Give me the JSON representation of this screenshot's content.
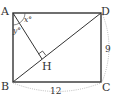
{
  "diagram": {
    "type": "geometry",
    "shape": "rectangle ABCD",
    "vertices": {
      "A": {
        "label": "A",
        "x": 13,
        "y": 13
      },
      "D": {
        "label": "D",
        "x": 101,
        "y": 13
      },
      "B": {
        "label": "B",
        "x": 13,
        "y": 82
      },
      "C": {
        "label": "C",
        "x": 101,
        "y": 82
      },
      "H": {
        "label": "H"
      }
    },
    "segments": [
      "AD",
      "DC",
      "CB",
      "BA",
      "BD",
      "AH"
    ],
    "angles": {
      "x": {
        "label": "x°"
      },
      "y": {
        "label": "y°"
      }
    },
    "dimensions": {
      "DC": {
        "label": "9"
      },
      "BC": {
        "label": "12"
      }
    },
    "right_angle_at": "H",
    "colors": {
      "lines": "#333333",
      "dimension_arc": "#aaaaaa"
    }
  }
}
